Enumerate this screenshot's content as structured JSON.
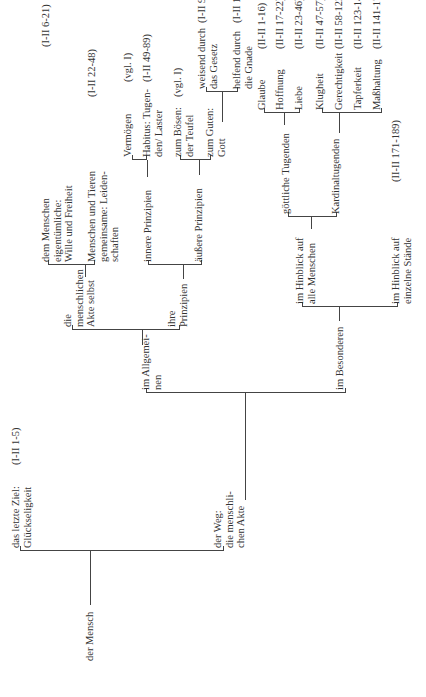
{
  "diagram": {
    "root": "der Mensch",
    "goal": {
      "label": "das letzte Ziel:\nGlückseligkeit",
      "ref": "(I-II 1-5)"
    },
    "way": {
      "label": "der Weg:\ndie menschli-\nchen Akte"
    },
    "general": {
      "label": "im Allgemei-\nnen"
    },
    "acts": {
      "label": "die\nmenschlichen\nAkte selbst"
    },
    "acts_human": {
      "label": "dem Menschen\neigentümliche:\nWille und Freiheit",
      "ref": "(I-II 6-21)"
    },
    "acts_common": {
      "label": "Menschen und Tieren\ngemeinsame: Leiden-\nschaften",
      "ref": "(I-II 22-48)"
    },
    "principles": {
      "label": "ihre\nPrinzipien"
    },
    "inner": {
      "label": "innere Prinzipien"
    },
    "faculties": {
      "label": "Vermögen",
      "ref": "(vgl. I)"
    },
    "habitus": {
      "label": "Habitus: Tugen-\nden/ Laster",
      "ref": "(I-II 49-89)"
    },
    "outer": {
      "label": "äußere Prinzipien"
    },
    "evil": {
      "label": "zum Bösen:\nder Teufel",
      "ref": "(vgl. I)"
    },
    "good": {
      "label": "zum Guten:\nGott"
    },
    "law": {
      "label": "weisend durch\ndas Gesetz",
      "ref": "(I-II 90-108)"
    },
    "grace": {
      "label": "helfend durch\ndie Gnade",
      "ref": "(I-II 109-114)"
    },
    "special": {
      "label": "im Besonderen"
    },
    "all_people": {
      "label": "im Hinblick auf\nalle Menschen"
    },
    "theological": {
      "label": "göttliche Tugenden"
    },
    "faith": {
      "label": "Glaube",
      "ref": "(II-II 1-16)"
    },
    "hope": {
      "label": "Hoffnung",
      "ref": "(II-II 17-22)"
    },
    "love": {
      "label": "Liebe",
      "ref": "(II-II 23-46)"
    },
    "cardinal": {
      "label": "Kardinaltugenden"
    },
    "prudence": {
      "label": "Klugheit",
      "ref": "(II-II 47-57)"
    },
    "justice": {
      "label": "Gerechtigkeit",
      "ref": "(II-II 58-122)"
    },
    "fortitude": {
      "label": "Tapferkeit",
      "ref": "(II-II 123-140)"
    },
    "temperance": {
      "label": "Maßhaltung",
      "ref": "(II-II 141-170)"
    },
    "states": {
      "label": "im Hinblick auf\neinzelne Stände",
      "ref": "(II-II 171-189)"
    }
  }
}
